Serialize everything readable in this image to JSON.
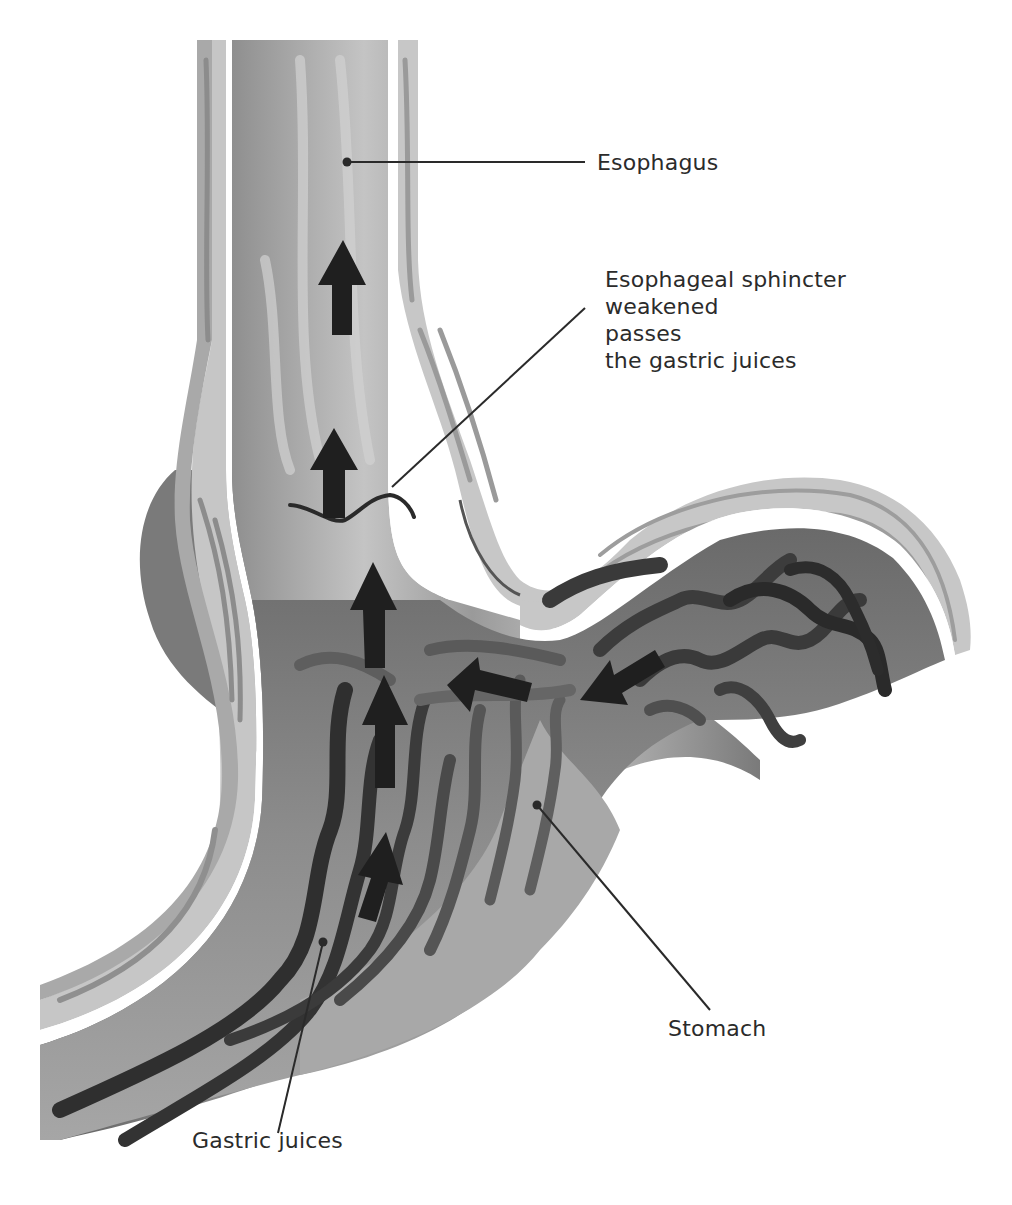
{
  "diagram": {
    "colors": {
      "background": "#ffffff",
      "text": "#2b2b2b",
      "arrow": "#1f1f1f",
      "leader_line": "#2a2a2a",
      "wall_light": "#c8c8c8",
      "wall_mid": "#a8a8a8",
      "lumen_dark": "#6e6e6e",
      "fold_dark": "#3a3a3a"
    },
    "labels": {
      "esophagus": "Esophagus",
      "sphincter": {
        "line1": "Esophageal sphincter",
        "line2": "weakened",
        "line3": "passes",
        "line4": "the gastric juices"
      },
      "stomach": "Stomach",
      "gastric_juices": "Gastric juices"
    },
    "arrows": [
      {
        "name": "reflux-arrow-upper",
        "direction": "up"
      },
      {
        "name": "reflux-arrow-mid",
        "direction": "up"
      },
      {
        "name": "reflux-arrow-sphincter",
        "direction": "up"
      },
      {
        "name": "reflux-arrow-lower",
        "direction": "up"
      },
      {
        "name": "reflux-arrow-bottom",
        "direction": "up"
      },
      {
        "name": "reflux-arrow-stomach-left",
        "direction": "left"
      },
      {
        "name": "reflux-arrow-stomach-right",
        "direction": "down-left"
      }
    ]
  }
}
